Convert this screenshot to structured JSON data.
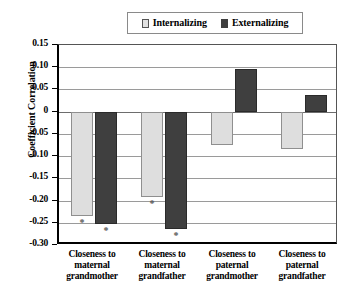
{
  "chart_data": {
    "type": "bar",
    "title": "",
    "subtitle": "",
    "xlabel": "",
    "ylabel": "Coefficient Correlation",
    "ylim": [
      -0.3,
      0.15
    ],
    "ytick_step": 0.05,
    "ytick_labels": [
      "0.15",
      "0.10",
      "0.05",
      "0",
      "-0.05",
      "-0.10",
      "-0.15",
      "-0.20",
      "-0.25",
      "-0.30"
    ],
    "ytick_values": [
      0.15,
      0.1,
      0.05,
      0,
      -0.05,
      -0.1,
      -0.15,
      -0.2,
      -0.25,
      -0.3
    ],
    "grid": true,
    "grid_axis": "y",
    "legend_position": "top-center",
    "categories": [
      "Closeness to maternal grandmother",
      "Closeness to maternal grandfather",
      "Closeness to paternal grandmother",
      "Closeness to paternal grandfather"
    ],
    "category_lines": [
      [
        "Closeness to",
        "maternal",
        "grandmother"
      ],
      [
        "Closeness to",
        "maternal",
        "grandfather"
      ],
      [
        "Closeness to",
        "paternal",
        "grandmother"
      ],
      [
        "Closeness to",
        "paternal",
        "grandfather"
      ]
    ],
    "series": [
      {
        "name": "Internalizing",
        "color": "#dedede",
        "values": [
          -0.235,
          -0.193,
          -0.075,
          -0.085
        ],
        "significance": [
          "*",
          "*",
          "",
          ""
        ]
      },
      {
        "name": "Externalizing",
        "color": "#3f3f3f",
        "values": [
          -0.252,
          -0.265,
          0.097,
          0.037
        ],
        "significance": [
          "*",
          "*",
          "",
          ""
        ]
      }
    ],
    "annotations": [
      {
        "text": "*",
        "series": "Internalizing",
        "category": "Closeness to maternal grandmother",
        "meaning": "significant"
      },
      {
        "text": "*",
        "series": "Externalizing",
        "category": "Closeness to maternal grandmother",
        "meaning": "significant"
      },
      {
        "text": "*",
        "series": "Internalizing",
        "category": "Closeness to maternal grandfather",
        "meaning": "significant"
      },
      {
        "text": "*",
        "series": "Externalizing",
        "category": "Closeness to maternal grandfather",
        "meaning": "significant"
      }
    ]
  },
  "legend": {
    "items": [
      {
        "label": "Internalizing",
        "swatch": "light-gray-square"
      },
      {
        "label": "Externalizing",
        "swatch": "dark-gray-square"
      }
    ]
  }
}
